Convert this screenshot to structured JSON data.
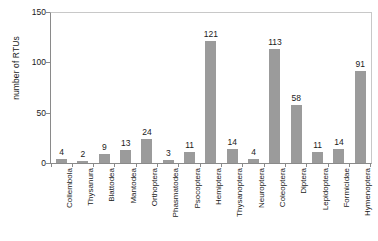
{
  "chart_data": {
    "type": "bar",
    "title": "",
    "xlabel": "",
    "ylabel": "number of RTUs",
    "ylim": [
      0,
      150
    ],
    "yticks": [
      0,
      50,
      100,
      150
    ],
    "grid": false,
    "legend": "none",
    "bar_color": "#9b9b9b",
    "axis_color": "#8a8a8a",
    "frame_color": "#c8c8c8",
    "show_value_labels": true,
    "categories": [
      "Collembola",
      "Thysanura",
      "Blattodea",
      "Mantodea",
      "Orthoptera",
      "Phasmatodea",
      "Psocoptera",
      "Hemiptera",
      "Thysanoptera",
      "Neuroptera",
      "Coleoptera",
      "Diptera",
      "Lepidoptera",
      "Formicidae",
      "Hymenoptera"
    ],
    "values": [
      4,
      2,
      9,
      13,
      24,
      3,
      11,
      121,
      14,
      4,
      113,
      58,
      11,
      14,
      91
    ]
  }
}
